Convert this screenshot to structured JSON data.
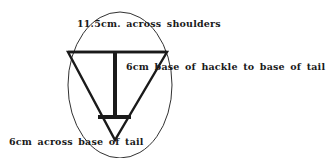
{
  "diagram": {
    "labels": {
      "shoulders": "11.5cm. across shoulders",
      "hackle_to_tail": "6cm base of hackle to base of tail",
      "tail_base": "6cm across base of tail"
    },
    "colors": {
      "stroke": "#1a1a1a",
      "background": "#ffffff"
    }
  }
}
